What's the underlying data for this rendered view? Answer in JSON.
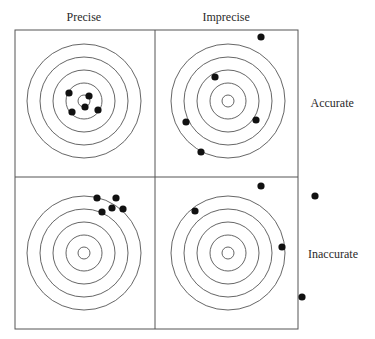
{
  "column_headers": [
    {
      "label": "Precise",
      "x": 84,
      "y": 17
    },
    {
      "label": "Imprecise",
      "x": 226,
      "y": 17
    }
  ],
  "row_labels": [
    {
      "label": "Accurate",
      "x": 332,
      "y": 103
    },
    {
      "label": "Inaccurate",
      "x": 333,
      "y": 254
    }
  ],
  "colors": {
    "line": "#555555",
    "ring": "#555555",
    "dot": "#111111",
    "text": "#2a2a2a"
  },
  "grid": {
    "left": 15,
    "top": 30,
    "mid_x": 155,
    "mid_y": 177,
    "right": 298,
    "bottom": 329
  },
  "ring_radii": [
    6,
    18,
    31,
    44,
    57
  ],
  "targets": [
    {
      "name": "precise-accurate",
      "cx": 84,
      "cy": 101,
      "dots": [
        [
          69,
          93
        ],
        [
          89,
          96
        ],
        [
          85,
          107
        ],
        [
          72,
          112
        ],
        [
          98,
          110
        ]
      ]
    },
    {
      "name": "imprecise-accurate",
      "cx": 228,
      "cy": 101,
      "dots": [
        [
          261,
          37
        ],
        [
          215,
          77
        ],
        [
          186,
          122
        ],
        [
          256,
          120
        ],
        [
          201,
          152
        ]
      ]
    },
    {
      "name": "precise-inaccurate",
      "cx": 84,
      "cy": 253,
      "dots": [
        [
          97,
          198
        ],
        [
          116,
          198
        ],
        [
          112,
          208
        ],
        [
          123,
          209
        ],
        [
          102,
          212
        ]
      ]
    },
    {
      "name": "imprecise-inaccurate",
      "cx": 228,
      "cy": 253,
      "dots": [
        [
          261,
          186
        ],
        [
          315,
          196
        ],
        [
          195,
          211
        ],
        [
          282,
          247
        ],
        [
          302,
          297
        ]
      ]
    }
  ]
}
